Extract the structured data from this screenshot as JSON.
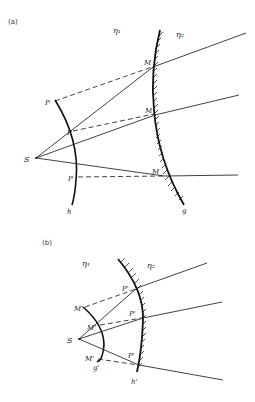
{
  "figure": {
    "panel_a": {
      "label": "(a)",
      "medium_1": "η₁",
      "medium_2": "η₂",
      "source": "S",
      "wavefront_label": "h",
      "mirror_label": "g",
      "wavefront_points": [
        "P",
        "P",
        "P"
      ],
      "mirror_points": [
        "M",
        "M",
        "M"
      ]
    },
    "panel_b": {
      "label": "(b)",
      "medium_1": "η₁",
      "medium_2": "η₂",
      "source": "S",
      "wavefront_label": "g'",
      "mirror_label": "h'",
      "wavefront_points": [
        "M'",
        "M'",
        "M'"
      ],
      "mirror_points": [
        "P'",
        "P'",
        "P'"
      ]
    }
  }
}
